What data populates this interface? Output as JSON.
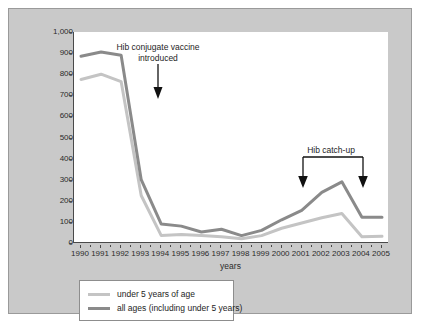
{
  "chart_data": {
    "type": "line",
    "title": "",
    "xlabel": "years",
    "ylabel": "",
    "xlim": [
      1990,
      2005
    ],
    "ylim": [
      0,
      1000
    ],
    "grid": false,
    "legend_position": "bottom-left",
    "x": [
      1990,
      1991,
      1992,
      1993,
      1994,
      1995,
      1996,
      1997,
      1998,
      1999,
      2000,
      2001,
      2002,
      2003,
      2004,
      2005
    ],
    "xtick_labels": [
      "1990",
      "1991",
      "1992",
      "1993",
      "1994",
      "1995",
      "1996",
      "1997",
      "1998",
      "1999",
      "2000",
      "2001",
      "2002",
      "2003",
      "2004",
      "2005"
    ],
    "ytick_labels": [
      "0",
      "100",
      "200",
      "300",
      "400",
      "500",
      "600",
      "700",
      "800",
      "900",
      "1,000"
    ],
    "ytick_values": [
      0,
      100,
      200,
      300,
      400,
      500,
      600,
      700,
      800,
      900,
      1000
    ],
    "series": [
      {
        "name": "under 5 years of age",
        "color": "#c4c4c4",
        "values": [
          775,
          800,
          765,
          225,
          35,
          40,
          35,
          30,
          20,
          35,
          70,
          95,
          120,
          140,
          30,
          32
        ]
      },
      {
        "name": "all ages (including under 5 years)",
        "color": "#8a8a8a",
        "values": [
          885,
          905,
          890,
          300,
          90,
          80,
          52,
          65,
          35,
          60,
          110,
          155,
          240,
          290,
          122,
          122
        ]
      }
    ],
    "annotations": [
      {
        "id": "vaccine-introduced",
        "text": "Hib conjugate vaccine introduced",
        "line1": "Hib conjugate vaccine",
        "line2": "introduced",
        "marker": "down-arrow",
        "x": 1992.6
      },
      {
        "id": "hib-catch-up",
        "text": "Hib catch-up",
        "marker": "bracket-with-two-down-arrows",
        "x_start": 2001,
        "x_end": 2004
      }
    ]
  },
  "legend": {
    "rows": [
      {
        "label": "under 5 years of age",
        "color": "#c4c4c4"
      },
      {
        "label": "all ages (including under 5 years)",
        "color": "#8a8a8a"
      }
    ]
  },
  "colors": {
    "panel_background": "#c9c9c9",
    "plot_background": "#ffffff",
    "axis": "#4a4a4a",
    "text": "#1e1e1e",
    "series_under5": "#c4c4c4",
    "series_all_ages": "#8a8a8a"
  }
}
